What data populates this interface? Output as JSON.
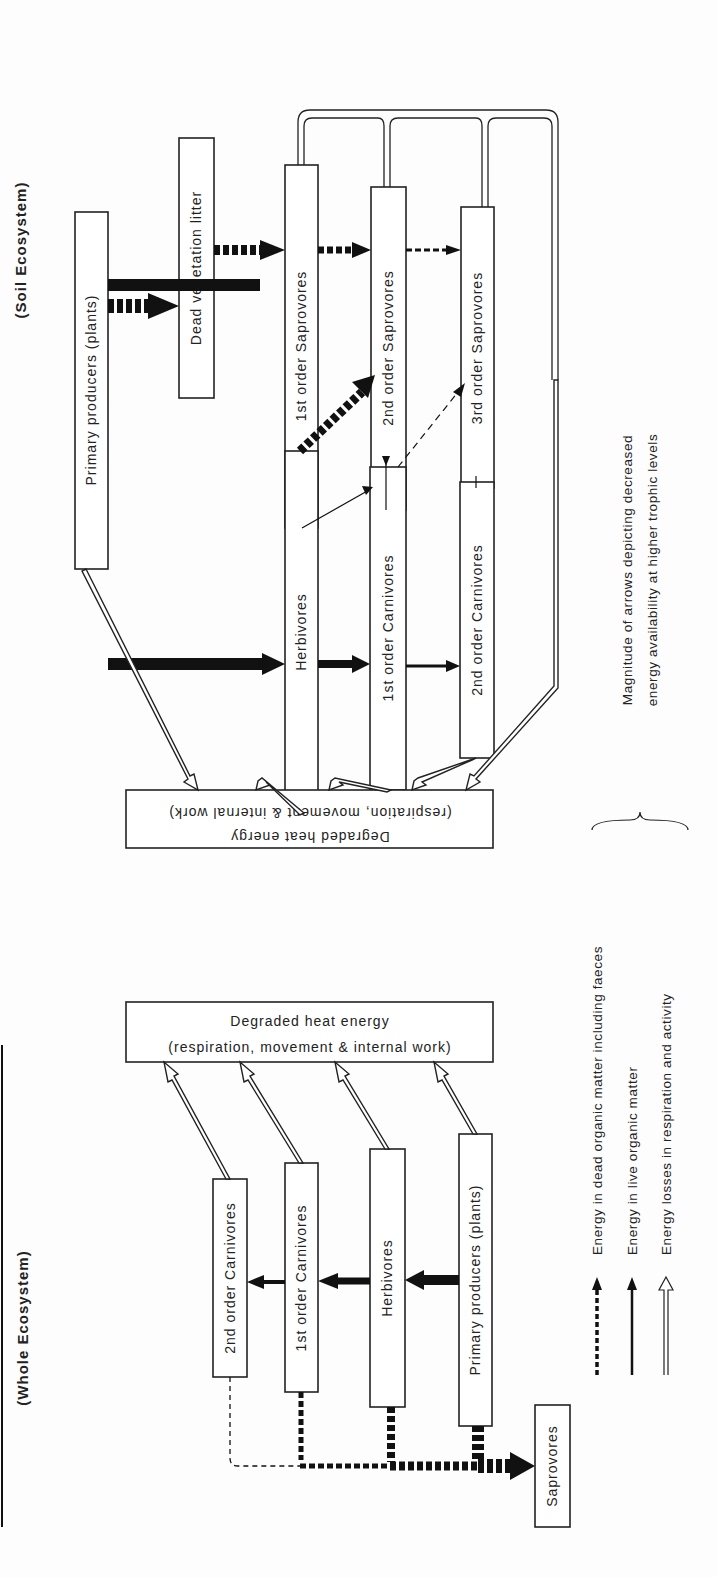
{
  "titles": {
    "soil": "(Soil Ecosystem)",
    "whole": "(Whole Ecosystem)"
  },
  "soil": {
    "primary_producers": "Primary producers (plants)",
    "dead_litter": "Dead vegetation litter",
    "herbivores": "Herbivores",
    "sap1": "1st order Saprovores",
    "sap2": "2nd order Saprovores",
    "sap3": "3rd order Saprovores",
    "carn1": "1st order Carnivores",
    "carn2": "2nd order Carnivores",
    "heat_line1": "Degraded heat energy",
    "heat_line2": "(respiration, movement & internal work)"
  },
  "whole": {
    "primary_producers": "Primary producers (plants)",
    "herbivores": "Herbivores",
    "carn1": "1st order Carnivores",
    "carn2": "2nd order Carnivores",
    "saprovores": "Saprovores",
    "heat_line1": "Degraded heat energy",
    "heat_line2": "(respiration, movement & internal work)"
  },
  "legend": {
    "dead": "Energy in dead organic matter including faeces",
    "live": "Energy in live organic matter",
    "losses": "Energy losses in respiration and activity",
    "note_line1": "Magnitude of arrows depicting decreased",
    "note_line2": "energy availability at higher trophic levels"
  }
}
